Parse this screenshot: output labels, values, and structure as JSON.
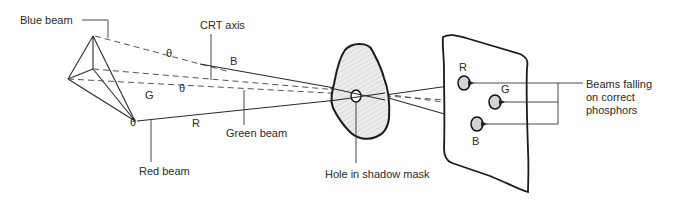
{
  "diagram": {
    "labels": {
      "blue_beam": "Blue beam",
      "crt_axis": "CRT axis",
      "green_beam": "Green beam",
      "red_beam": "Red beam",
      "hole": "Hole in shadow mask",
      "beams_falling_1": "Beams falling",
      "beams_falling_2": "on correct",
      "beams_falling_3": "phosphors"
    },
    "beam_letters": {
      "b": "B",
      "g": "G",
      "r": "R"
    },
    "phosphor_letters": {
      "r": "R",
      "g": "G",
      "b": "B"
    },
    "theta": "θ",
    "colors": {
      "line": "#2a2a2a",
      "mask_fill": "#e6e6e6",
      "phosphor_fill": "#d4d4d4"
    }
  }
}
